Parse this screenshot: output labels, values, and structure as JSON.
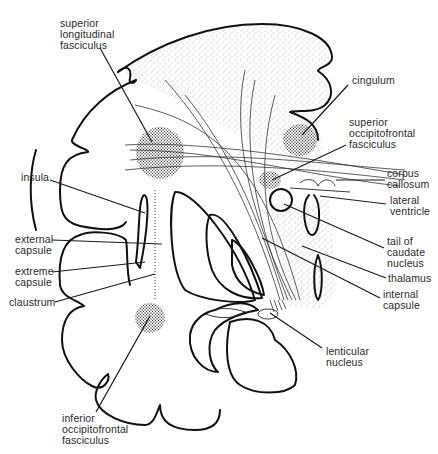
{
  "figure": {
    "colors": {
      "ink": "#111111",
      "background": "#ffffff",
      "label_text": "#2a2a2a"
    }
  },
  "labels": [
    {
      "id": "superior-longitudinal-fasciculus",
      "text": "superior\nlongitudinal\nfasciculus",
      "x": 60,
      "y": 18
    },
    {
      "id": "cingulum",
      "text": "cingulum",
      "x": 352,
      "y": 75
    },
    {
      "id": "superior-occipitofrontal-fasciculus",
      "text": "superior\noccipitofrontal\nfasciculus",
      "x": 349,
      "y": 117
    },
    {
      "id": "corpus-callosum",
      "text": "corpus\ncallosum",
      "x": 387,
      "y": 168
    },
    {
      "id": "lateral-ventricle",
      "text": "lateral\nventricle",
      "x": 390,
      "y": 195
    },
    {
      "id": "insula",
      "text": "insula",
      "x": 21,
      "y": 172
    },
    {
      "id": "tail-of-caudate-nucleus",
      "text": "tail of\ncaudate\nnucleus",
      "x": 387,
      "y": 236
    },
    {
      "id": "external-capsule",
      "text": "external\ncapsule",
      "x": 15,
      "y": 234
    },
    {
      "id": "thalamus",
      "text": "thalamus",
      "x": 388,
      "y": 273
    },
    {
      "id": "extreme-capsule",
      "text": "extreme\ncapsule",
      "x": 15,
      "y": 270
    },
    {
      "id": "internal-capsule",
      "text": "internal\ncapsule",
      "x": 383,
      "y": 293
    },
    {
      "id": "claustrum",
      "text": "claustrum",
      "x": 9,
      "y": 298
    },
    {
      "id": "lenticular-nucleus",
      "text": "lenticular\nnucleus",
      "x": 326,
      "y": 347
    },
    {
      "id": "inferior-occipitofrontal-fasciculus",
      "text": "inferior\noccipitofrontal\nfasciculus",
      "x": 62,
      "y": 413
    }
  ]
}
